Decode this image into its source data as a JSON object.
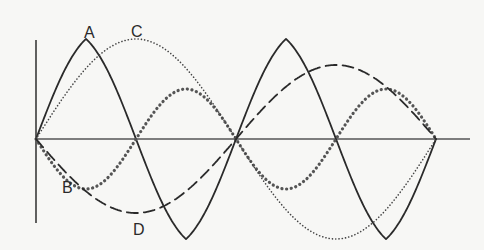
{
  "diagram": {
    "type": "waveform-comparison",
    "axes": {
      "origin": [
        36,
        139
      ],
      "vertical_axis": {
        "x": 36,
        "y_top": 40,
        "y_bottom": 223
      },
      "horizontal_axis": {
        "y": 139,
        "x_start": 36,
        "x_end": 470
      }
    },
    "waves": [
      {
        "label": "A",
        "style": "solid",
        "amplitude": 100,
        "period": 200,
        "phase": "positive-first",
        "color": "#2a2a2a"
      },
      {
        "label": "B",
        "style": "large-dots",
        "amplitude": 50,
        "period": 200,
        "phase": "negative-first",
        "color": "#555555"
      },
      {
        "label": "C",
        "style": "fine-dots",
        "amplitude": 100,
        "period": 400,
        "phase": "positive-first",
        "color": "#444444"
      },
      {
        "label": "D",
        "style": "dashed",
        "amplitude": 74,
        "period": 400,
        "phase": "negative-first",
        "color": "#2a2a2a"
      }
    ],
    "labels": [
      {
        "text": "A",
        "x": 84,
        "y": 38
      },
      {
        "text": "C",
        "x": 131,
        "y": 37
      },
      {
        "text": "B",
        "x": 62,
        "y": 193
      },
      {
        "text": "D",
        "x": 133,
        "y": 235
      }
    ]
  }
}
